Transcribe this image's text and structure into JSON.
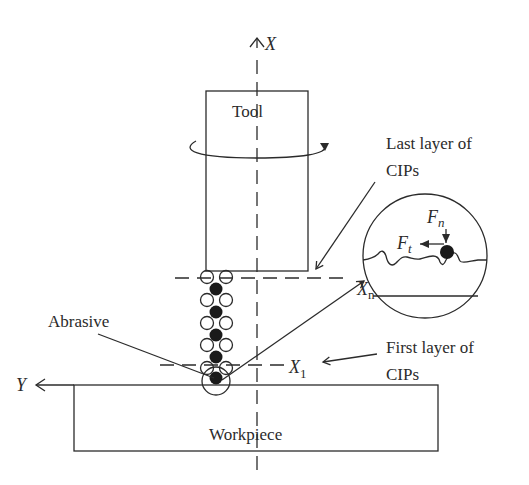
{
  "labels": {
    "x_axis": "X",
    "y_axis": "Y",
    "tool": "Tool",
    "workpiece": "Workpiece",
    "abrasive": "Abrasive",
    "last_layer_line1": "Last layer of",
    "last_layer_line2": "CIPs",
    "first_layer_line1": "First layer of",
    "first_layer_line2": "CIPs",
    "xn_main": "X",
    "xn_sub": "n",
    "x1_main": "X",
    "x1_sub": "1",
    "fn_main": "F",
    "fn_sub": "n",
    "ft_main": "F",
    "ft_sub": "t"
  },
  "colors": {
    "stroke": "#2b2b2b",
    "background": "#ffffff"
  }
}
